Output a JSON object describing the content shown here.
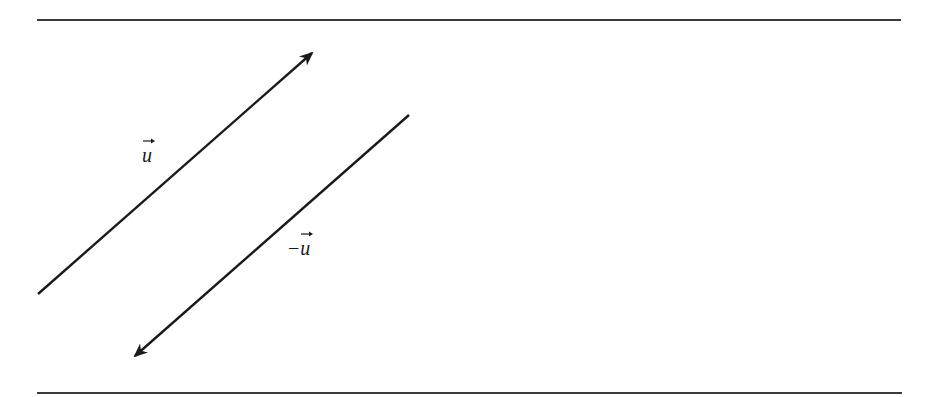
{
  "figure": {
    "type": "vector-diagram",
    "colors": {
      "background": "#ffffff",
      "stroke": "#1a1a1a",
      "rule": "#3a3a3a"
    },
    "rules": {
      "top": {
        "x1": 37,
        "x2": 901,
        "y": 20
      },
      "bottom": {
        "x1": 37,
        "x2": 902,
        "y": 393
      }
    },
    "vectors": [
      {
        "name": "u",
        "label_symbol": "u",
        "label_prefix": "",
        "from": [
          38,
          294
        ],
        "to": [
          312,
          53
        ],
        "label_pos": [
          142,
          145
        ]
      },
      {
        "name": "negative-u",
        "label_symbol": "u",
        "label_prefix": "−",
        "from": [
          409,
          115
        ],
        "to": [
          135,
          356
        ],
        "label_pos": [
          288,
          238
        ]
      }
    ]
  }
}
